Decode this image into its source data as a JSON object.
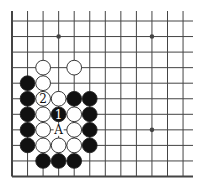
{
  "diagram": {
    "type": "go-board-fragment",
    "grid": {
      "cols": 12,
      "rows": 11,
      "origin_x": 12,
      "origin_y": 21,
      "spacing": 15.55,
      "top_stub": 11,
      "right_extend": 193,
      "left_edge_thick": true,
      "bottom_edge_thick": true
    },
    "colors": {
      "line": "#444444",
      "black_stone": "#111111",
      "white_stone": "#ffffff",
      "stone_outline": "#222222",
      "background": "#ffffff"
    },
    "star_points": [
      {
        "col": 3,
        "row": 1
      },
      {
        "col": 9,
        "row": 1
      },
      {
        "col": 9,
        "row": 7
      }
    ],
    "stones": [
      {
        "color": "white",
        "col": 2,
        "row": 3
      },
      {
        "color": "white",
        "col": 4,
        "row": 3
      },
      {
        "color": "black",
        "col": 1,
        "row": 4
      },
      {
        "color": "white",
        "col": 2,
        "row": 4
      },
      {
        "color": "black",
        "col": 1,
        "row": 5
      },
      {
        "color": "white",
        "col": 2,
        "row": 5,
        "label": "2"
      },
      {
        "color": "white",
        "col": 3,
        "row": 5
      },
      {
        "color": "black",
        "col": 4,
        "row": 5
      },
      {
        "color": "black",
        "col": 5,
        "row": 5
      },
      {
        "color": "black",
        "col": 1,
        "row": 6
      },
      {
        "color": "white",
        "col": 2,
        "row": 6
      },
      {
        "color": "black",
        "col": 3,
        "row": 6,
        "label": "1"
      },
      {
        "color": "white",
        "col": 4,
        "row": 6
      },
      {
        "color": "black",
        "col": 5,
        "row": 6
      },
      {
        "color": "black",
        "col": 1,
        "row": 7
      },
      {
        "color": "white",
        "col": 2,
        "row": 7
      },
      {
        "color": "white",
        "col": 4,
        "row": 7
      },
      {
        "color": "black",
        "col": 5,
        "row": 7
      },
      {
        "color": "black",
        "col": 1,
        "row": 8
      },
      {
        "color": "white",
        "col": 2,
        "row": 8
      },
      {
        "color": "white",
        "col": 3,
        "row": 8
      },
      {
        "color": "white",
        "col": 4,
        "row": 8
      },
      {
        "color": "black",
        "col": 5,
        "row": 8
      },
      {
        "color": "black",
        "col": 2,
        "row": 9
      },
      {
        "color": "black",
        "col": 3,
        "row": 9
      },
      {
        "color": "black",
        "col": 4,
        "row": 9
      }
    ],
    "markers": [
      {
        "col": 3,
        "row": 7,
        "label": "A"
      }
    ]
  }
}
